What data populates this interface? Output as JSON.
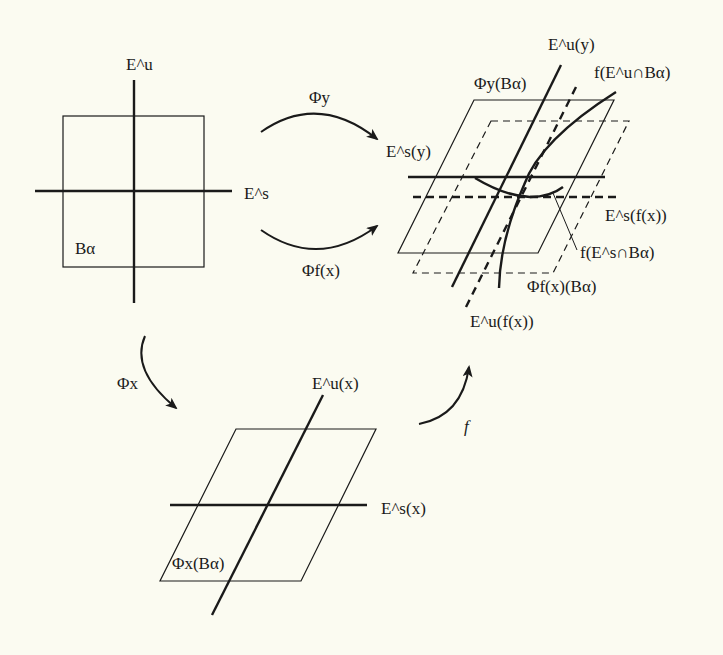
{
  "figure": {
    "panels": {
      "top_left": {
        "box_label": "Bα",
        "vertical_axis_label": "E^u",
        "horizontal_axis_label": "E^s"
      },
      "top_right": {
        "labels": {
          "eu_y": "E^u(y)",
          "f_eu_cap_b": "f(E^u∩Bα)",
          "phi_y_b": "Φy(Bα)",
          "es_y": "E^s(y)",
          "es_fx": "E^s(f(x))",
          "f_es_cap_b": "f(E^s∩Bα)",
          "phi_fx_b": "Φf(x)(Bα)",
          "eu_fx": "E^u(f(x))"
        }
      },
      "bottom": {
        "labels": {
          "eu_x": "E^u(x)",
          "es_x": "E^s(x)",
          "phi_x_b": "Φx(Bα)"
        }
      }
    },
    "arrows": {
      "phi_y": "Φy",
      "phi_fx": "Φf(x)",
      "phi_x": "Φx",
      "f": "f"
    },
    "colors": {
      "background": "#fbfbf1",
      "ink": "#1a1a1a"
    }
  }
}
